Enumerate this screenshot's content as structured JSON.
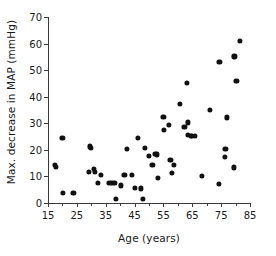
{
  "chart_data": {
    "type": "scatter",
    "title": "",
    "xlabel": "Age (years)",
    "ylabel": "Max. decrease in MAP (mmHg)",
    "xlim": [
      15,
      85
    ],
    "ylim": [
      0,
      70
    ],
    "xticks": [
      15,
      25,
      35,
      45,
      55,
      65,
      75,
      85
    ],
    "xticks_minor": [
      20,
      30,
      40,
      50,
      60,
      70,
      80
    ],
    "yticks": [
      0,
      10,
      20,
      30,
      40,
      50,
      60,
      70
    ],
    "xtick_labels": [
      "15",
      "25",
      "35",
      "45",
      "55",
      "65",
      "75",
      "85"
    ],
    "ytick_labels": [
      "0",
      "10",
      "20",
      "30",
      "40",
      "50",
      "60",
      "70"
    ],
    "grid": false,
    "legend": null,
    "marker": "filled-circle",
    "marker_color": "#111111",
    "n_points": 63,
    "points": [
      [
        17.5,
        14.4
      ],
      [
        17.6,
        13.5
      ],
      [
        20.0,
        24.6
      ],
      [
        20.2,
        3.8
      ],
      [
        23.8,
        3.8
      ],
      [
        29.3,
        11.6
      ],
      [
        29.6,
        21.3
      ],
      [
        30.0,
        20.7
      ],
      [
        31.0,
        12.7
      ],
      [
        31.3,
        11.8
      ],
      [
        32.3,
        7.6
      ],
      [
        33.2,
        10.6
      ],
      [
        36.0,
        7.6
      ],
      [
        37.0,
        7.6
      ],
      [
        38.0,
        7.6
      ],
      [
        38.6,
        1.6
      ],
      [
        40.2,
        6.6
      ],
      [
        41.5,
        10.6
      ],
      [
        42.3,
        20.5
      ],
      [
        44.0,
        10.6
      ],
      [
        45.2,
        5.6
      ],
      [
        46.2,
        24.6
      ],
      [
        47.3,
        5.5
      ],
      [
        48.0,
        1.5
      ],
      [
        48.7,
        20.6
      ],
      [
        50.0,
        17.6
      ],
      [
        51.2,
        14.4
      ],
      [
        52.2,
        18.6
      ],
      [
        52.8,
        18.3
      ],
      [
        53.0,
        9.5
      ],
      [
        55.0,
        32.3
      ],
      [
        55.3,
        27.4
      ],
      [
        57.0,
        29.4
      ],
      [
        57.4,
        16.2
      ],
      [
        58.0,
        11.3
      ],
      [
        58.6,
        14.4
      ],
      [
        60.8,
        37.4
      ],
      [
        62.3,
        28.6
      ],
      [
        63.5,
        30.3
      ],
      [
        63.6,
        25.6
      ],
      [
        64.4,
        25.3
      ],
      [
        65.0,
        25.4
      ],
      [
        65.8,
        25.3
      ],
      [
        63.0,
        45.3
      ],
      [
        68.3,
        10.3
      ],
      [
        71.0,
        35.1
      ],
      [
        74.2,
        7.3
      ],
      [
        74.4,
        53.2
      ],
      [
        76.3,
        17.3
      ],
      [
        76.5,
        20.3
      ],
      [
        77.0,
        32.2
      ],
      [
        79.3,
        13.4
      ],
      [
        79.6,
        55.2
      ],
      [
        80.3,
        46.1
      ],
      [
        81.6,
        61.0
      ]
    ]
  }
}
